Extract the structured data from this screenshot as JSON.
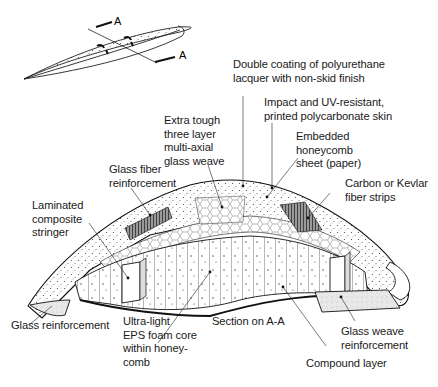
{
  "diagram": {
    "type": "cutaway cross-section",
    "inset": {
      "section_marks": [
        "A",
        "A"
      ]
    },
    "labels": {
      "double_coating": "Double coating of polyurethane\nlacquer with non-skid finish",
      "impact_uv_skin": "Impact and UV-resistant,\nprinted polycarbonate skin",
      "extra_tough_weave": "Extra tough\nthree layer\nmulti-axial\nglass weave",
      "embedded_honeycomb": "Embedded\nhoneycomb\nsheet (paper)",
      "glass_fiber_reinforcement": "Glass fiber\nreinforcement",
      "carbon_kevlar_strips": "Carbon or Kevlar\nfiber strips",
      "laminated_stringer": "Laminated\ncomposite\nstringer",
      "glass_reinforcement": "Glass reinforcement",
      "eps_foam_core": "Ultra-light\nEPS foam core\nwithin honey-\ncomb",
      "section_caption": "Section on A-A",
      "glass_weave_reinforcement": "Glass weave\nreinforcement",
      "compound_layer": "Compound layer"
    }
  }
}
